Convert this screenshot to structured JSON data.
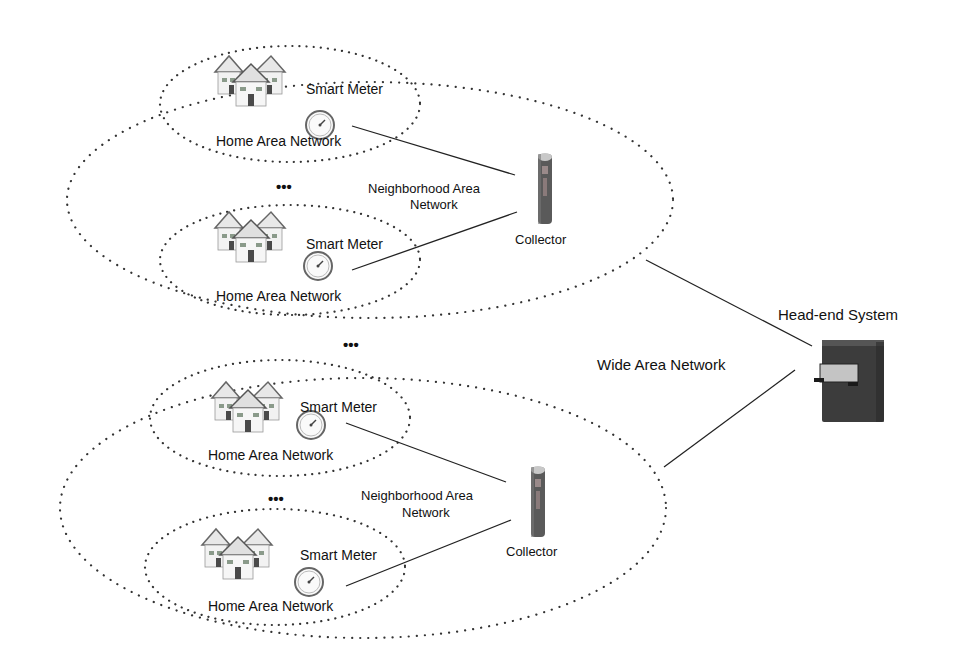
{
  "diagram": {
    "colors": {
      "line": "#222222",
      "dots": "#333333",
      "collector_body": "#555555",
      "collector_accent": "#8a8a8a",
      "server_body": "#3c3c3c",
      "server_panel": "#bdbdbd"
    },
    "wan_label": "Wide Area Network",
    "headend_label": "Head-end System",
    "ellipsis": "•••",
    "nans": [
      {
        "label_line1": "Neighborhood Area",
        "label_line2": "Network",
        "collector_label": "Collector",
        "hans": [
          {
            "meter_label": "Smart Meter",
            "han_label": "Home Area Network"
          },
          {
            "meter_label": "Smart Meter",
            "han_label": "Home Area Network"
          }
        ]
      },
      {
        "label_line1": "Neighborhood Area",
        "label_line2": "Network",
        "collector_label": "Collector",
        "hans": [
          {
            "meter_label": "Smart Meter",
            "han_label": "Home Area Network"
          },
          {
            "meter_label": "Smart Meter",
            "han_label": "Home Area Network"
          }
        ]
      }
    ]
  }
}
